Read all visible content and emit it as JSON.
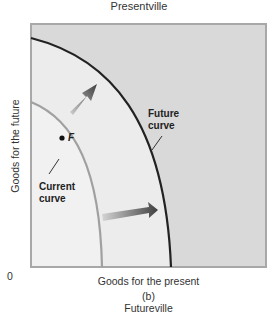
{
  "diagram": {
    "title_top": "Presentville",
    "panel_label": "(b)",
    "title_bottom": "Futureville",
    "y_axis_label": "Goods for the future",
    "x_axis_label": "Goods for the present",
    "origin_label": "0",
    "curves": [
      {
        "name": "Current curve",
        "label_line1": "Current",
        "label_line2": "curve",
        "color": "#a0a0a0"
      },
      {
        "name": "Future curve",
        "label_line1": "Future",
        "label_line2": "curve",
        "color": "#222222"
      }
    ],
    "point": {
      "label": "F"
    },
    "colors": {
      "inside_fill": "#ececec",
      "outside_fill": "#d9d9d9",
      "frame": "#a8a8a8",
      "arrow_dark": "#444444",
      "arrow_light": "#c8c8c8"
    }
  }
}
